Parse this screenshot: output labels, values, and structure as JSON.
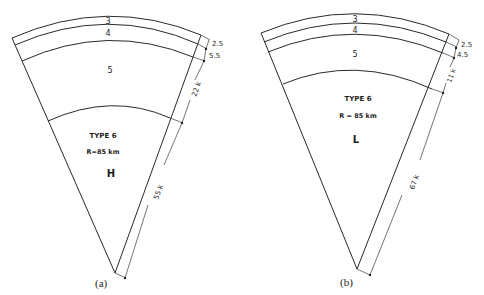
{
  "figures": [
    {
      "id": "a",
      "caption": "(a)",
      "layers": [
        "3",
        "4",
        "5"
      ],
      "type_label": "TYPE 6",
      "radius_label": "R=85 km",
      "class_letter": "H",
      "dimensions": [
        "2.5",
        "5.5",
        "22 k",
        "55 k"
      ]
    },
    {
      "id": "b",
      "caption": "(b)",
      "layers": [
        "3",
        "4",
        "5"
      ],
      "type_label": "TYPE  6",
      "radius_label": "R = 85  km",
      "class_letter": "L",
      "dimensions": [
        "2.5",
        "4.5",
        "11 k",
        "67 k"
      ]
    }
  ]
}
